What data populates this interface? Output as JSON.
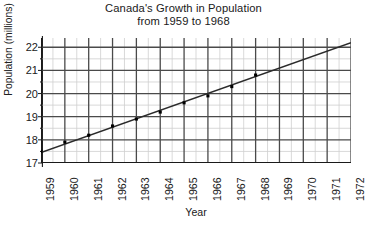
{
  "chart_data": {
    "type": "scatter",
    "title": "Canada's Growth in Population",
    "subtitle": "from 1959 to 1968",
    "title_lines": [
      "Canada's Growth in Population",
      "from 1959 to 1968"
    ],
    "xlabel": "Year",
    "ylabel": "Population (millions)",
    "xlim": [
      1959,
      1972
    ],
    "ylim": [
      17,
      22.4
    ],
    "grid": true,
    "grid_major_color": "#4a4a4a",
    "grid_minor_color": "#cfcfcf",
    "legend": null,
    "x_ticks": [
      1959,
      1960,
      1961,
      1962,
      1963,
      1964,
      1965,
      1966,
      1967,
      1968,
      1969,
      1970,
      1971,
      1972
    ],
    "x_tick_labels": [
      "1959",
      "1960",
      "1961",
      "1962",
      "1963",
      "1964",
      "1965",
      "1966",
      "1967",
      "1968",
      "1969",
      "1970",
      "1971",
      "1972"
    ],
    "y_ticks": [
      17,
      18,
      19,
      20,
      21,
      22
    ],
    "y_tick_labels": [
      "17",
      "18",
      "19",
      "20",
      "21",
      "22"
    ],
    "y_minor_step": 0.5,
    "x_minor_step": 0.5,
    "x": [
      1959,
      1960,
      1961,
      1962,
      1963,
      1964,
      1965,
      1966,
      1967,
      1968
    ],
    "values": [
      17.5,
      17.9,
      18.2,
      18.6,
      18.9,
      19.2,
      19.6,
      19.9,
      20.3,
      20.8
    ],
    "marker": "filled-square",
    "marker_color": "#000000",
    "trend_line": {
      "label": "line of best fit",
      "x_start": 1959,
      "y_start": 17.45,
      "x_end": 1972,
      "y_end": 22.2,
      "color": "#2b2b2b"
    }
  }
}
